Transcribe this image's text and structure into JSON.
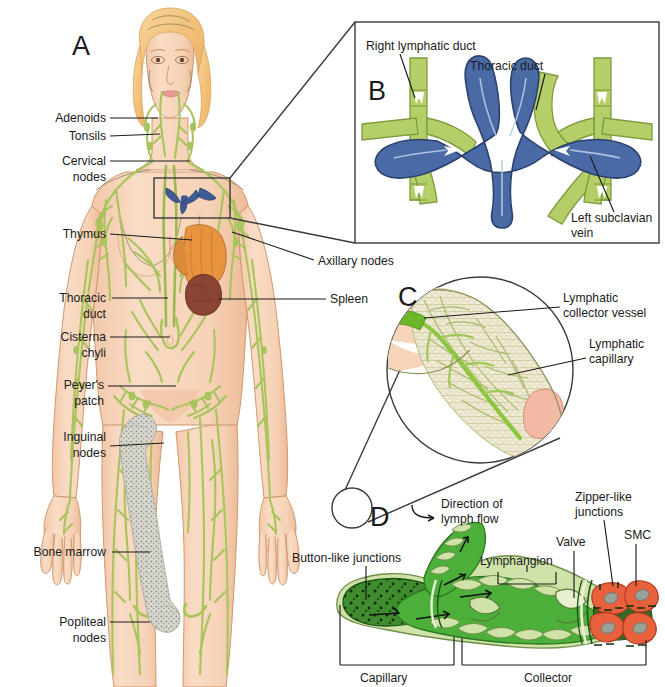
{
  "figure": {
    "panels": [
      "A",
      "B",
      "C",
      "D"
    ]
  },
  "colors": {
    "skin": "#f7d5bb",
    "skin_shadow": "#f0c0a2",
    "hair": "#f4c88a",
    "lymph_green": "#a8c45c",
    "lymph_green_light": "#c8d98f",
    "vein_blue": "#4a6aa5",
    "vein_blue_dark": "#3d5a92",
    "thymus_orange": "#e8943f",
    "spleen_maroon": "#8a4434",
    "bone_gray": "#c9c9bf",
    "capillary_dark_green": "#3f8c2f",
    "collector_green": "#4caf3a",
    "smc_orange": "#e8603c",
    "outline": "#1b1b1b"
  },
  "panelA": {
    "letter": "A",
    "labels": [
      {
        "id": "adenoids",
        "text": "Adenoids"
      },
      {
        "id": "tonsils",
        "text": "Tonsils"
      },
      {
        "id": "cervical-nodes",
        "line1": "Cervical",
        "line2": "nodes"
      },
      {
        "id": "thymus",
        "text": "Thymus"
      },
      {
        "id": "thoracic-duct",
        "line1": "Thoracic",
        "line2": "duct"
      },
      {
        "id": "cisterna-chyli",
        "line1": "Cisterna",
        "line2": "chyli"
      },
      {
        "id": "peyers-patch",
        "line1": "Peyer's",
        "line2": "patch"
      },
      {
        "id": "inguinal-nodes",
        "line1": "Inguinal",
        "line2": "nodes"
      },
      {
        "id": "bone-marrow",
        "text": "Bone marrow"
      },
      {
        "id": "popliteal-nodes",
        "line1": "Popliteal",
        "line2": "nodes"
      },
      {
        "id": "axillary-nodes",
        "text": "Axillary nodes"
      },
      {
        "id": "spleen",
        "text": "Spleen"
      }
    ]
  },
  "panelB": {
    "letter": "B",
    "labels": [
      {
        "id": "right-lymphatic-duct",
        "text": "Right lymphatic duct"
      },
      {
        "id": "thoracic-duct",
        "text": "Thoracic duct"
      },
      {
        "id": "left-subclavian-vein",
        "line1": "Left subclavian",
        "line2": "vein"
      }
    ]
  },
  "panelC": {
    "letter": "C",
    "labels": [
      {
        "id": "lymphatic-collector-vessel",
        "line1": "Lymphatic",
        "line2": "collector vessel"
      },
      {
        "id": "lymphatic-capillary",
        "line1": "Lymphatic",
        "line2": "capillary"
      }
    ]
  },
  "panelD": {
    "letter": "D",
    "labels": [
      {
        "id": "direction-of-lymph-flow",
        "line1": "Direction of",
        "line2": "lymph flow"
      },
      {
        "id": "button-like-junctions",
        "text": "Button-like junctions"
      },
      {
        "id": "lymphangion",
        "text": "Lymphangion"
      },
      {
        "id": "valve",
        "text": "Valve"
      },
      {
        "id": "zipper-like-junctions",
        "line1": "Zipper-like",
        "line2": "junctions"
      },
      {
        "id": "smc",
        "text": "SMC"
      },
      {
        "id": "capillary",
        "text": "Capillary"
      },
      {
        "id": "collector",
        "text": "Collector"
      }
    ]
  }
}
